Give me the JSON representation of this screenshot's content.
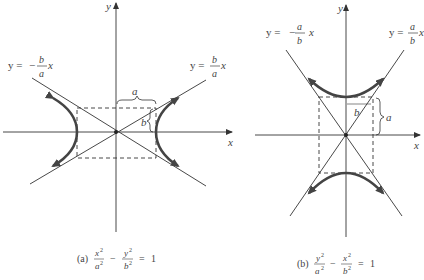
{
  "figure": {
    "panel_a": {
      "caption_prefix": "(a)",
      "equation": {
        "term1_num": "x",
        "term1_den": "a",
        "term2_num": "y",
        "term2_den": "b",
        "exp": "2",
        "minus": "−",
        "equals": "=",
        "rhs": "1"
      },
      "axis_x_label": "x",
      "axis_y_label": "y",
      "asymptote_pos": {
        "lhs": "y =",
        "num": "b",
        "den": "a",
        "var": "x"
      },
      "asymptote_neg": {
        "lhs": "y =",
        "sign": "−",
        "num": "b",
        "den": "a",
        "var": "x"
      },
      "brace_a_label": "a",
      "brace_b_label": "b"
    },
    "panel_b": {
      "caption_prefix": "(b)",
      "equation": {
        "term1_num": "y",
        "term1_den": "a",
        "term2_num": "x",
        "term2_den": "b",
        "exp": "2",
        "minus": "−",
        "equals": "=",
        "rhs": "1"
      },
      "axis_x_label": "x",
      "axis_y_label": "y",
      "asymptote_pos": {
        "lhs": "y =",
        "num": "a",
        "den": "b",
        "var": "x"
      },
      "asymptote_neg": {
        "lhs": "y =",
        "sign": "−",
        "num": "a",
        "den": "b",
        "var": "x"
      },
      "brace_a_label": "a",
      "brace_b_label": "b"
    },
    "colors": {
      "line": "#333333",
      "curve": "#444444",
      "background": "#ffffff"
    }
  }
}
